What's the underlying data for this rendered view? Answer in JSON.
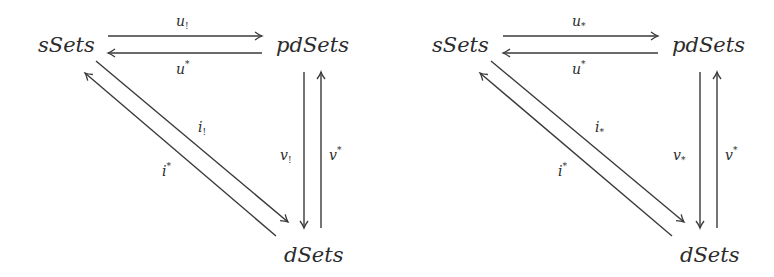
{
  "diagrams": [
    {
      "id": "left",
      "nodes": {
        "top_left": "sSets",
        "top_right": "pdSets",
        "bottom": "dSets"
      },
      "arrows": {
        "top_forward": {
          "base": "u",
          "mod": "!"
        },
        "top_back": {
          "base": "u",
          "mod": "*"
        },
        "diag_down": {
          "base": "i",
          "mod": "!"
        },
        "diag_up": {
          "base": "i",
          "mod": "*"
        },
        "vert_down": {
          "base": "v",
          "mod": "!"
        },
        "vert_up": {
          "base": "v",
          "mod": "*"
        }
      }
    },
    {
      "id": "right",
      "nodes": {
        "top_left": "sSets",
        "top_right": "pdSets",
        "bottom": "dSets"
      },
      "arrows": {
        "top_forward": {
          "base": "u",
          "mod": "*"
        },
        "top_back": {
          "base": "u",
          "mod": "*"
        },
        "diag_down": {
          "base": "i",
          "mod": "*"
        },
        "diag_up": {
          "base": "i",
          "mod": "*"
        },
        "vert_down": {
          "base": "v",
          "mod": "*"
        },
        "vert_up": {
          "base": "v",
          "mod": "*"
        }
      }
    }
  ],
  "colors": {
    "ink": "#2b2b2b",
    "background": "#ffffff"
  }
}
